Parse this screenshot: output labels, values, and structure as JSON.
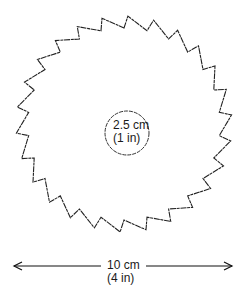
{
  "diagram": {
    "serrated_shape": {
      "teeth": 26,
      "center": [
        124,
        124
      ],
      "outer_radius": 108,
      "inner_radius": 96,
      "stroke": "#222222"
    },
    "inner_circle": {
      "center": [
        127,
        133
      ],
      "radius": 22,
      "label_line1": "2.5 cm",
      "label_line2": "(1 in)"
    },
    "dimension": {
      "label_line1": "10 cm",
      "label_line2": "(4 in)",
      "x_start": 14,
      "x_end": 232,
      "y": 266
    }
  }
}
